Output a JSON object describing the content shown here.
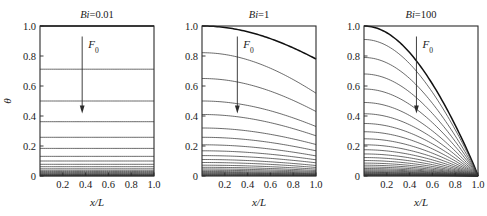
{
  "figure": {
    "name": "transient-conduction-temperature-profiles",
    "background": "#ffffff",
    "line_color": "#3a3a3a",
    "axis_color": "#2b2b2b"
  },
  "chart_data": [
    {
      "type": "line",
      "title": "Bi=0.01",
      "title_symbol": "Bi",
      "title_value": "0.01",
      "xlabel": "x/L",
      "ylabel": "θ",
      "xlim": [
        0,
        1
      ],
      "ylim": [
        0,
        1
      ],
      "xticks": [
        0.2,
        0.4,
        0.6,
        0.8,
        1.0
      ],
      "xticklabels": [
        "0.2",
        "0.4",
        "0.6",
        "0.8",
        "1.0"
      ],
      "yticks": [
        0,
        0.2,
        0.4,
        0.6,
        0.8,
        1.0
      ],
      "yticklabels": [
        "0",
        "0.2",
        "0.4",
        "0.6",
        "0.8",
        "1.0"
      ],
      "grid": false,
      "legend": "none",
      "annotation": {
        "text": "F₀",
        "symbol": "F",
        "subscript": "0",
        "meaning": "Fourier-number-increasing",
        "arrow": "down"
      },
      "series_note": "Nearly flat isothermal profiles (lumped behaviour); each curve is a later Fourier number",
      "series": [
        {
          "name": "Fo-01",
          "theta_left": 1.0,
          "theta_right": 1.0,
          "bold": true
        },
        {
          "name": "Fo-02",
          "theta_left": 0.712,
          "theta_right": 0.712
        },
        {
          "name": "Fo-03",
          "theta_left": 0.5,
          "theta_right": 0.5
        },
        {
          "name": "Fo-04",
          "theta_left": 0.362,
          "theta_right": 0.362
        },
        {
          "name": "Fo-05",
          "theta_left": 0.258,
          "theta_right": 0.258
        },
        {
          "name": "Fo-06",
          "theta_left": 0.184,
          "theta_right": 0.184
        },
        {
          "name": "Fo-07",
          "theta_left": 0.131,
          "theta_right": 0.131
        },
        {
          "name": "Fo-08",
          "theta_left": 0.1,
          "theta_right": 0.1
        },
        {
          "name": "Fo-09",
          "theta_left": 0.078,
          "theta_right": 0.078
        },
        {
          "name": "Fo-10",
          "theta_left": 0.062,
          "theta_right": 0.062
        },
        {
          "name": "Fo-11",
          "theta_left": 0.048,
          "theta_right": 0.048
        },
        {
          "name": "Fo-12",
          "theta_left": 0.038,
          "theta_right": 0.038
        },
        {
          "name": "Fo-13",
          "theta_left": 0.03,
          "theta_right": 0.03
        },
        {
          "name": "Fo-14",
          "theta_left": 0.023,
          "theta_right": 0.023
        },
        {
          "name": "Fo-15",
          "theta_left": 0.018,
          "theta_right": 0.018
        },
        {
          "name": "Fo-16",
          "theta_left": 0.014,
          "theta_right": 0.014
        },
        {
          "name": "Fo-17",
          "theta_left": 0.01,
          "theta_right": 0.01
        },
        {
          "name": "Fo-18",
          "theta_left": 0.007,
          "theta_right": 0.007
        },
        {
          "name": "Fo-19",
          "theta_left": 0.005,
          "theta_right": 0.005
        },
        {
          "name": "Fo-20",
          "theta_left": 0.003,
          "theta_right": 0.003
        },
        {
          "name": "Fo-21",
          "theta_left": 0.001,
          "theta_right": 0.001
        }
      ]
    },
    {
      "type": "line",
      "title": "Bi=1",
      "title_symbol": "Bi",
      "title_value": "1",
      "xlabel": "x/L",
      "ylabel": "θ",
      "xlim": [
        0,
        1
      ],
      "ylim": [
        0,
        1
      ],
      "xticks": [
        0.2,
        0.4,
        0.6,
        0.8,
        1.0
      ],
      "xticklabels": [
        "0.2",
        "0.4",
        "0.6",
        "0.8",
        "1.0"
      ],
      "yticks": [
        0,
        0.2,
        0.4,
        0.6,
        0.8,
        1.0
      ],
      "yticklabels": [
        "0",
        "0.2",
        "0.4",
        "0.6",
        "0.8",
        "1.0"
      ],
      "grid": false,
      "legend": "none",
      "annotation": {
        "text": "F₀",
        "symbol": "F",
        "subscript": "0",
        "meaning": "Fourier-number-increasing",
        "arrow": "down"
      },
      "series_note": "Moderately curved profiles; surface at x/L=1 cooler than centre",
      "series": [
        {
          "name": "Fo-01",
          "theta_left": 1.0,
          "theta_right": 0.78,
          "bold": true
        },
        {
          "name": "Fo-02",
          "theta_left": 0.822,
          "theta_right": 0.552
        },
        {
          "name": "Fo-03",
          "theta_left": 0.65,
          "theta_right": 0.43
        },
        {
          "name": "Fo-04",
          "theta_left": 0.5,
          "theta_right": 0.33
        },
        {
          "name": "Fo-05",
          "theta_left": 0.41,
          "theta_right": 0.268
        },
        {
          "name": "Fo-06",
          "theta_left": 0.32,
          "theta_right": 0.21
        },
        {
          "name": "Fo-07",
          "theta_left": 0.258,
          "theta_right": 0.168
        },
        {
          "name": "Fo-08",
          "theta_left": 0.208,
          "theta_right": 0.134
        },
        {
          "name": "Fo-09",
          "theta_left": 0.168,
          "theta_right": 0.108
        },
        {
          "name": "Fo-10",
          "theta_left": 0.136,
          "theta_right": 0.088
        },
        {
          "name": "Fo-11",
          "theta_left": 0.11,
          "theta_right": 0.07
        },
        {
          "name": "Fo-12",
          "theta_left": 0.09,
          "theta_right": 0.057
        },
        {
          "name": "Fo-13",
          "theta_left": 0.072,
          "theta_right": 0.046
        },
        {
          "name": "Fo-14",
          "theta_left": 0.058,
          "theta_right": 0.037
        },
        {
          "name": "Fo-15",
          "theta_left": 0.047,
          "theta_right": 0.03
        },
        {
          "name": "Fo-16",
          "theta_left": 0.038,
          "theta_right": 0.024
        },
        {
          "name": "Fo-17",
          "theta_left": 0.03,
          "theta_right": 0.019
        },
        {
          "name": "Fo-18",
          "theta_left": 0.024,
          "theta_right": 0.015
        },
        {
          "name": "Fo-19",
          "theta_left": 0.019,
          "theta_right": 0.012
        },
        {
          "name": "Fo-20",
          "theta_left": 0.015,
          "theta_right": 0.01
        },
        {
          "name": "Fo-21",
          "theta_left": 0.011,
          "theta_right": 0.007
        },
        {
          "name": "Fo-22",
          "theta_left": 0.008,
          "theta_right": 0.005
        },
        {
          "name": "Fo-23",
          "theta_left": 0.005,
          "theta_right": 0.003
        },
        {
          "name": "Fo-24",
          "theta_left": 0.003,
          "theta_right": 0.002
        }
      ]
    },
    {
      "type": "line",
      "title": "Bi=100",
      "title_symbol": "Bi",
      "title_value": "100",
      "xlabel": "x/L",
      "ylabel": "θ",
      "xlim": [
        0,
        1
      ],
      "ylim": [
        0,
        1
      ],
      "xticks": [
        0.2,
        0.4,
        0.6,
        0.8,
        1.0
      ],
      "xticklabels": [
        "0.2",
        "0.4",
        "0.6",
        "0.8",
        "1.0"
      ],
      "yticks": [
        0,
        0.2,
        0.4,
        0.6,
        0.8,
        1.0
      ],
      "yticklabels": [
        "0",
        "0.2",
        "0.4",
        "0.6",
        "0.8",
        "1.0"
      ],
      "grid": false,
      "legend": "none",
      "annotation": {
        "text": "F₀",
        "symbol": "F",
        "subscript": "0",
        "meaning": "Fourier-number-increasing",
        "arrow": "down"
      },
      "series_note": "Strongly curved profiles all pinned to theta=0 at the surface x/L=1",
      "series": [
        {
          "name": "Fo-01",
          "theta_left": 1.0,
          "theta_right": 0.0,
          "bold": true
        },
        {
          "name": "Fo-02",
          "theta_left": 0.91,
          "theta_right": 0.0
        },
        {
          "name": "Fo-03",
          "theta_left": 0.79,
          "theta_right": 0.0
        },
        {
          "name": "Fo-04",
          "theta_left": 0.68,
          "theta_right": 0.0
        },
        {
          "name": "Fo-05",
          "theta_left": 0.58,
          "theta_right": 0.0
        },
        {
          "name": "Fo-06",
          "theta_left": 0.49,
          "theta_right": 0.0
        },
        {
          "name": "Fo-07",
          "theta_left": 0.415,
          "theta_right": 0.0
        },
        {
          "name": "Fo-08",
          "theta_left": 0.35,
          "theta_right": 0.0
        },
        {
          "name": "Fo-09",
          "theta_left": 0.295,
          "theta_right": 0.0
        },
        {
          "name": "Fo-10",
          "theta_left": 0.248,
          "theta_right": 0.0
        },
        {
          "name": "Fo-11",
          "theta_left": 0.208,
          "theta_right": 0.0
        },
        {
          "name": "Fo-12",
          "theta_left": 0.175,
          "theta_right": 0.0
        },
        {
          "name": "Fo-13",
          "theta_left": 0.147,
          "theta_right": 0.0
        },
        {
          "name": "Fo-14",
          "theta_left": 0.123,
          "theta_right": 0.0
        },
        {
          "name": "Fo-15",
          "theta_left": 0.103,
          "theta_right": 0.0
        },
        {
          "name": "Fo-16",
          "theta_left": 0.086,
          "theta_right": 0.0
        },
        {
          "name": "Fo-17",
          "theta_left": 0.072,
          "theta_right": 0.0
        },
        {
          "name": "Fo-18",
          "theta_left": 0.06,
          "theta_right": 0.0
        },
        {
          "name": "Fo-19",
          "theta_left": 0.05,
          "theta_right": 0.0
        },
        {
          "name": "Fo-20",
          "theta_left": 0.042,
          "theta_right": 0.0
        },
        {
          "name": "Fo-21",
          "theta_left": 0.035,
          "theta_right": 0.0
        },
        {
          "name": "Fo-22",
          "theta_left": 0.029,
          "theta_right": 0.0
        },
        {
          "name": "Fo-23",
          "theta_left": 0.024,
          "theta_right": 0.0
        },
        {
          "name": "Fo-24",
          "theta_left": 0.02,
          "theta_right": 0.0
        },
        {
          "name": "Fo-25",
          "theta_left": 0.016,
          "theta_right": 0.0
        },
        {
          "name": "Fo-26",
          "theta_left": 0.013,
          "theta_right": 0.0
        },
        {
          "name": "Fo-27",
          "theta_left": 0.01,
          "theta_right": 0.0
        },
        {
          "name": "Fo-28",
          "theta_left": 0.008,
          "theta_right": 0.0
        },
        {
          "name": "Fo-29",
          "theta_left": 0.006,
          "theta_right": 0.0
        },
        {
          "name": "Fo-30",
          "theta_left": 0.004,
          "theta_right": 0.0
        },
        {
          "name": "Fo-31",
          "theta_left": 0.002,
          "theta_right": 0.0
        }
      ]
    }
  ]
}
